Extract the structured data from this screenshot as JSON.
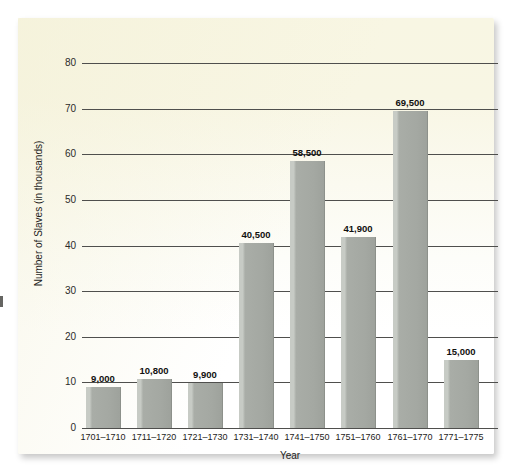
{
  "chart_data": {
    "type": "bar",
    "title": "",
    "xlabel": "Year",
    "ylabel": "Number of Slaves (in thousands)",
    "categories": [
      "1701–1710",
      "1711–1720",
      "1721–1730",
      "1731–1740",
      "1741–1750",
      "1751–1760",
      "1761–1770",
      "1771–1775"
    ],
    "values": [
      9000,
      10800,
      9900,
      40500,
      58500,
      41900,
      69500,
      15000
    ],
    "value_labels": [
      "9,000",
      "10,800",
      "9,900",
      "40,500",
      "58,500",
      "41,900",
      "69,500",
      "15,000"
    ],
    "ylim": [
      0,
      80
    ],
    "ytick_labels": [
      "0",
      "10",
      "20",
      "30",
      "40",
      "50",
      "60",
      "70",
      "80"
    ],
    "ytick_values": [
      0,
      10,
      20,
      30,
      40,
      50,
      60,
      70,
      80
    ],
    "grid": true,
    "legend": "none",
    "units_note": "y-axis values are in thousands",
    "bar_color": "#a9ada7",
    "gridline_color": "#4f4f4d",
    "panel_color": "#f8f6e3"
  }
}
